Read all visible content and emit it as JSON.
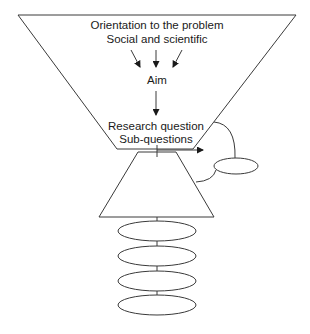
{
  "diagram": {
    "funnel": {
      "lines": [
        "Orientation to the problem",
        "Social and scientific"
      ],
      "aim_label": "Aim",
      "question_lines": [
        "Research question",
        "Sub-questions"
      ]
    },
    "colors": {
      "stroke": "#3a3a3a",
      "text": "#1a1a1a",
      "background": "#ffffff"
    },
    "stacked_ellipse_count": 4,
    "side_ellipse_count": 1
  }
}
